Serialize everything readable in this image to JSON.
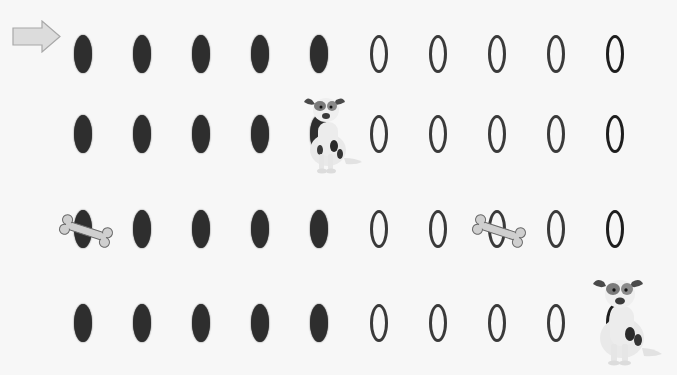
{
  "scene": {
    "description": "Counting grid of ovals: 4 rows x 10 columns; first five in each row filled, last five hollow",
    "columns_x": [
      83,
      142,
      201,
      260,
      319,
      379,
      438,
      497,
      556,
      615
    ],
    "rows": [
      {
        "y": 54,
        "filled": 5,
        "hollow": 5
      },
      {
        "y": 134,
        "filled": 5,
        "hollow": 5
      },
      {
        "y": 229,
        "filled": 5,
        "hollow": 5
      },
      {
        "y": 323,
        "filled": 5,
        "hollow": 5
      }
    ],
    "colors": {
      "background": "#f7f7f7",
      "filled_oval": "#2e2e2e",
      "hollow_oval_stroke": "#3a3a3a",
      "arrow_fill": "#dcdcdc",
      "arrow_stroke": "#a8a8a8",
      "bone_fill": "#cfcfcf",
      "bone_stroke": "#6a6a6a"
    }
  },
  "overlays": {
    "arrow": {
      "icon": "arrow-right-icon",
      "x": 12,
      "y": 20
    },
    "dogs": [
      {
        "icon": "dog-icon",
        "x": 298,
        "y": 92,
        "covers": "row 2, position 5"
      },
      {
        "icon": "dog-icon",
        "x": 584,
        "y": 274,
        "covers": "row 4, position 10"
      }
    ],
    "bones": [
      {
        "icon": "bone-icon",
        "x": 56,
        "y": 214,
        "covers": "row 3, position 1"
      },
      {
        "icon": "bone-icon",
        "x": 469,
        "y": 214,
        "covers": "row 3, position 8"
      }
    ]
  }
}
